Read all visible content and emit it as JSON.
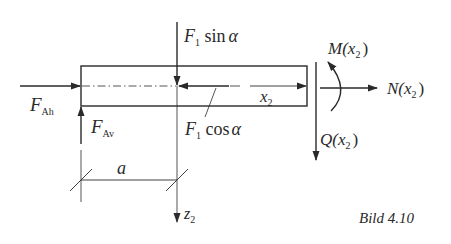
{
  "figure": {
    "caption": "Bild 4.10",
    "stroke_color": "#2a2a2a",
    "background": "#ffffff"
  },
  "labels": {
    "f_ah": {
      "main": "F",
      "sub": "Ah"
    },
    "f_av": {
      "main": "F",
      "sub": "Av"
    },
    "f1_sin": {
      "main": "F",
      "sub": "1",
      "rest": " sin",
      "greek": "α"
    },
    "f1_cos": {
      "main": "F",
      "sub": "1",
      "rest": " cos",
      "greek": "α"
    },
    "x2": {
      "main": "x",
      "sub": "2"
    },
    "moment": {
      "pre": "M(",
      "var": "x",
      "sub": "2",
      "post": ")"
    },
    "normal": {
      "pre": "N(",
      "var": "x",
      "sub": "2",
      "post": ")"
    },
    "shear": {
      "pre": "Q(",
      "var": "x",
      "sub": "2",
      "post": ")"
    },
    "dim_a": "a",
    "z2": {
      "main": "z",
      "sub": "2"
    }
  }
}
